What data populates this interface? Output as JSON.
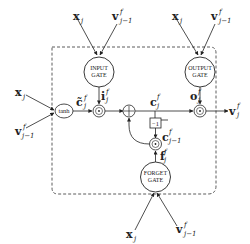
{
  "diagram": {
    "title": "",
    "type": "LSTM cell",
    "gates": {
      "input": {
        "line1": "INPUT",
        "line2": "GATE",
        "output_label": "i",
        "sup": "f",
        "sub": "j"
      },
      "output": {
        "line1": "OUTPUT",
        "line2": "GATE",
        "output_label": "o",
        "sup": "f",
        "sub": "j"
      },
      "forget": {
        "line1": "FORGET",
        "line2": "GATE",
        "output_label": "f",
        "sup": "f",
        "sub": "j"
      }
    },
    "activation": {
      "label": "tanh"
    },
    "delay": {
      "label": "−1"
    },
    "inputs": {
      "x": {
        "label": "x",
        "sub": "j"
      },
      "v": {
        "label": "v",
        "sup": "f",
        "sub": "j−1"
      }
    },
    "signals": {
      "c_tilde": {
        "label": "c̃",
        "sup": "f",
        "sub": "j"
      },
      "c": {
        "label": "c",
        "sup": "f",
        "sub": "j"
      },
      "c_prev": {
        "label": "c",
        "sup": "f",
        "sub": "j−1"
      },
      "v_out": {
        "label": "v",
        "sup": "f",
        "sub": "j"
      }
    },
    "operators": {
      "multiply": "⊙",
      "add": "+"
    }
  }
}
